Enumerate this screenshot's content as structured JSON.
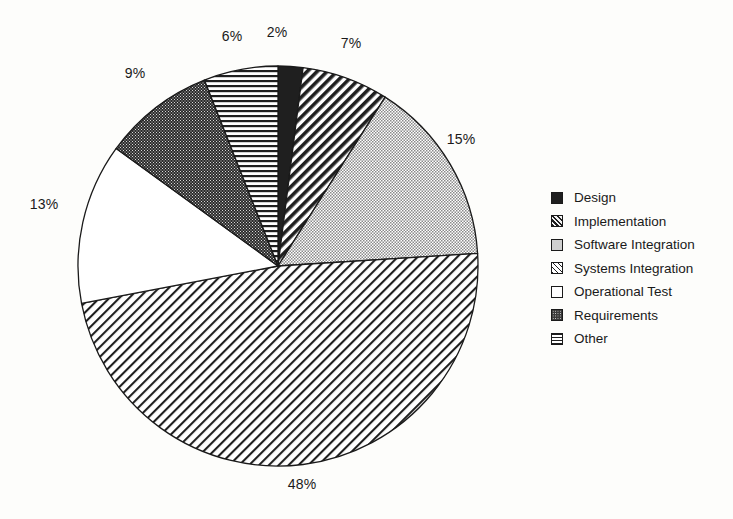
{
  "chart_data": {
    "type": "pie",
    "title": "",
    "subtitle": "",
    "xlabel": "",
    "ylabel": "",
    "grid": false,
    "legend_position": "right",
    "start_angle_deg": 0,
    "direction": "clockwise",
    "units": "percent",
    "categories": [
      "Design",
      "Implementation",
      "Software Integration",
      "Systems Integration",
      "Operational Test",
      "Requirements",
      "Other"
    ],
    "values": [
      2,
      7,
      15,
      48,
      13,
      9,
      6
    ],
    "data_labels": [
      "2%",
      "7%",
      "15%",
      "48%",
      "13%",
      "9%",
      "6%"
    ],
    "slices": [
      {
        "label": "Design",
        "value": 2,
        "data_label": "2%",
        "fill": "solid-dark",
        "order": 1
      },
      {
        "label": "Implementation",
        "value": 7,
        "data_label": "7%",
        "fill": "diag-dark",
        "order": 2
      },
      {
        "label": "Software Integration",
        "value": 15,
        "data_label": "15%",
        "fill": "stipple-gray",
        "order": 3
      },
      {
        "label": "Systems Integration",
        "value": 48,
        "data_label": "48%",
        "fill": "diag-light",
        "order": 4
      },
      {
        "label": "Operational Test",
        "value": 13,
        "data_label": "13%",
        "fill": "white",
        "order": 5
      },
      {
        "label": "Requirements",
        "value": 9,
        "data_label": "9%",
        "fill": "stipple-dark",
        "order": 6
      },
      {
        "label": "Other",
        "value": 6,
        "data_label": "6%",
        "fill": "horiz-lines",
        "order": 7
      }
    ],
    "colors": {
      "outline": "#1a1a1a",
      "background": "#fdfdfb",
      "text": "#1a1a1a",
      "stipple_gray": "#cfcfcf",
      "solid_dark": "#1f1f1f",
      "stipple_dark": "#3a3a3a"
    }
  },
  "legend": {
    "items": [
      {
        "label": "Design"
      },
      {
        "label": "Implementation"
      },
      {
        "label": "Software Integration"
      },
      {
        "label": "Systems Integration"
      },
      {
        "label": "Operational Test"
      },
      {
        "label": "Requirements"
      },
      {
        "label": "Other"
      }
    ]
  },
  "labels": {
    "design_pct": "2%",
    "implementation_pct": "7%",
    "software_integration_pct": "15%",
    "systems_integration_pct": "48%",
    "operational_test_pct": "13%",
    "requirements_pct": "9%",
    "other_pct": "6%"
  }
}
